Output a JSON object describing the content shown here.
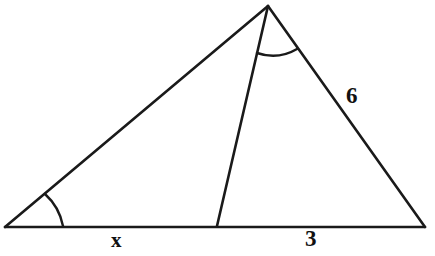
{
  "figure": {
    "kind": "geometry-diagram",
    "background_color": "#ffffff",
    "stroke_color": "#1a1a1a",
    "stroke_width": 2,
    "labels": {
      "left_segment": "x",
      "right_segment": "3",
      "right_side": "6"
    },
    "vertices": {
      "apex": {
        "name": "apex-vertex",
        "x": 268,
        "y": 6
      },
      "left": {
        "name": "left-vertex",
        "x": 5,
        "y": 227
      },
      "right": {
        "name": "right-vertex",
        "x": 425,
        "y": 227
      },
      "cevian_foot": {
        "name": "cevian-foot-vertex",
        "x": 217,
        "y": 226
      }
    },
    "segments": [
      {
        "name": "left-side",
        "from": "left",
        "to": "apex"
      },
      {
        "name": "base-line",
        "from": "left",
        "to": "right"
      },
      {
        "name": "right-side",
        "from": "apex",
        "to": "right"
      },
      {
        "name": "cevian-line",
        "from": "apex",
        "to": "cevian_foot"
      }
    ],
    "angle_marks": [
      {
        "name": "left-base-angle-arc",
        "at": "left",
        "radius": 58
      },
      {
        "name": "apex-angle-arc",
        "at": "apex",
        "radius": 48
      }
    ]
  }
}
